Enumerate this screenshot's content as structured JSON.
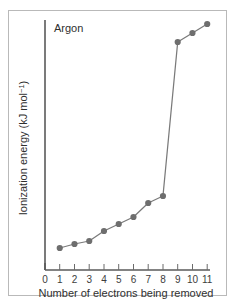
{
  "figure": {
    "name": "successive-ionization-energy-chart",
    "frame_color": "#b9b9b9",
    "background": "#ffffff"
  },
  "chart_data": {
    "type": "line",
    "title": "Argon",
    "xlabel": "Number of electrons being removed",
    "ylabel": "Ionization energy (kJ mol⁻¹)",
    "ylabel_main": "Ionization energy (kJ mol",
    "ylabel_sup": "−1",
    "ylabel_tail": ")",
    "x": [
      1,
      2,
      3,
      4,
      5,
      6,
      7,
      8,
      9,
      10,
      11
    ],
    "values": [
      0.088,
      0.104,
      0.116,
      0.156,
      0.184,
      0.212,
      0.268,
      0.296,
      0.912,
      0.948,
      0.984
    ],
    "xticks": [
      0,
      1,
      2,
      3,
      4,
      5,
      6,
      7,
      8,
      9,
      10,
      11
    ],
    "xticklabels": [
      "0",
      "1",
      "2",
      "3",
      "4",
      "5",
      "6",
      "7",
      "8",
      "9",
      "10",
      "11"
    ],
    "yticklabels": [],
    "xlim": [
      0,
      11
    ],
    "ylim": [
      0,
      1
    ],
    "grid": false,
    "legend": false,
    "line_color": "#7a7a7a",
    "marker_color": "#6e6e6e",
    "axis_color": "#5a5a5a",
    "annotation": "Large jump between the 8th and 9th electron removed"
  }
}
